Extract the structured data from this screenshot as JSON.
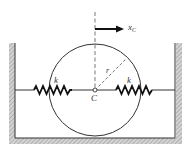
{
  "diagram": {
    "labels": {
      "displacement": "x",
      "displacement_sub": "C",
      "spring_left": "k",
      "spring_right": "k",
      "radius": "r",
      "center": "C"
    },
    "colors": {
      "stroke": "#333333",
      "hatch": "#9a9a9a",
      "background": "#ffffff"
    }
  }
}
